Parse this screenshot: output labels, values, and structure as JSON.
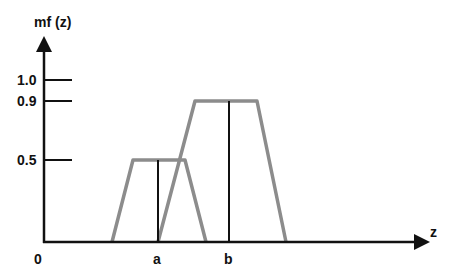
{
  "axes": {
    "y_label": "mf (z)",
    "x_label": "z",
    "origin_label": "0",
    "y_ticks": [
      {
        "label": "1.0",
        "value": 1.0
      },
      {
        "label": "0.9",
        "value": 0.9
      },
      {
        "label": "0.5",
        "value": 0.5
      }
    ],
    "x_ticks": [
      {
        "label": "a"
      },
      {
        "label": "b"
      }
    ]
  },
  "shapes": {
    "trapezoid_a": {
      "height": 0.5,
      "center_label": "a"
    },
    "trapezoid_b": {
      "height": 0.9,
      "center_label": "b"
    }
  },
  "colors": {
    "axis": "#111111",
    "trapezoid": "#8c8c8c"
  }
}
